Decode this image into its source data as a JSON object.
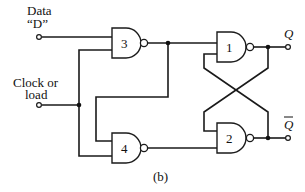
{
  "diagram": {
    "type": "logic-circuit",
    "caption": "(b)",
    "inputs": [
      {
        "id": "data",
        "label_line1": "Data",
        "label_line2": "“D”"
      },
      {
        "id": "clock",
        "label_line1": "Clock or",
        "label_line2": "load"
      }
    ],
    "outputs": [
      {
        "id": "q",
        "label": "Q"
      },
      {
        "id": "qbar",
        "label": "Q",
        "overbar": true
      }
    ],
    "gates": [
      {
        "id": "g1",
        "type": "NAND",
        "label": "1"
      },
      {
        "id": "g2",
        "type": "NAND",
        "label": "2"
      },
      {
        "id": "g3",
        "type": "NAND",
        "label": "3"
      },
      {
        "id": "g4",
        "type": "NAND",
        "label": "4"
      }
    ],
    "connections": [
      {
        "from": "Data D",
        "to": "g3.in1"
      },
      {
        "from": "Clock",
        "to": "g3.in2"
      },
      {
        "from": "Clock",
        "to": "g4.in2"
      },
      {
        "from": "g3.out",
        "to": "g1.in1"
      },
      {
        "from": "g3.out",
        "to": "g4.in1"
      },
      {
        "from": "g4.out",
        "to": "g2.in2"
      },
      {
        "from": "g1.out",
        "to": "Q"
      },
      {
        "from": "g2.out",
        "to": "Q-bar"
      },
      {
        "from": "g1.out",
        "to": "g2.in1",
        "note": "cross-coupled"
      },
      {
        "from": "g2.out",
        "to": "g1.in2",
        "note": "cross-coupled"
      }
    ],
    "colors": {
      "ink": "#1a1a1a",
      "background": "#ffffff"
    }
  }
}
